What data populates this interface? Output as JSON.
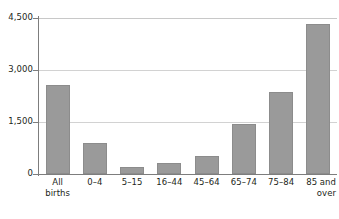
{
  "chart_data": {
    "type": "bar",
    "title": "",
    "subtitle": "",
    "xlabel": "",
    "ylabel": "",
    "categories": [
      "All births",
      "0–4",
      "5–15",
      "16–44",
      "45–64",
      "65–74",
      "75–84",
      "85 and over"
    ],
    "category_lines": [
      [
        "All",
        "births"
      ],
      [
        "0–4",
        ""
      ],
      [
        "5–15",
        ""
      ],
      [
        "16–44",
        ""
      ],
      [
        "45–64",
        ""
      ],
      [
        "65–74",
        ""
      ],
      [
        "75–84",
        ""
      ],
      [
        "85 and",
        "over"
      ]
    ],
    "values": [
      2560,
      900,
      200,
      330,
      530,
      1430,
      2370,
      4320
    ],
    "ylim": [
      0,
      4500
    ],
    "yticks": [
      0,
      1500,
      3000,
      4500
    ],
    "ytick_labels": [
      "0",
      "1,500",
      "3,000",
      "4,500"
    ],
    "grid": "horizontal",
    "legend": "none",
    "bar_color": "#9a9a9a",
    "bar_edge_color": "#8c8c8c",
    "gridline_color": "#d2d2d2",
    "axis_color": "#7d7d7d",
    "background_color": "#ffffff",
    "text_color": "#231f20"
  }
}
